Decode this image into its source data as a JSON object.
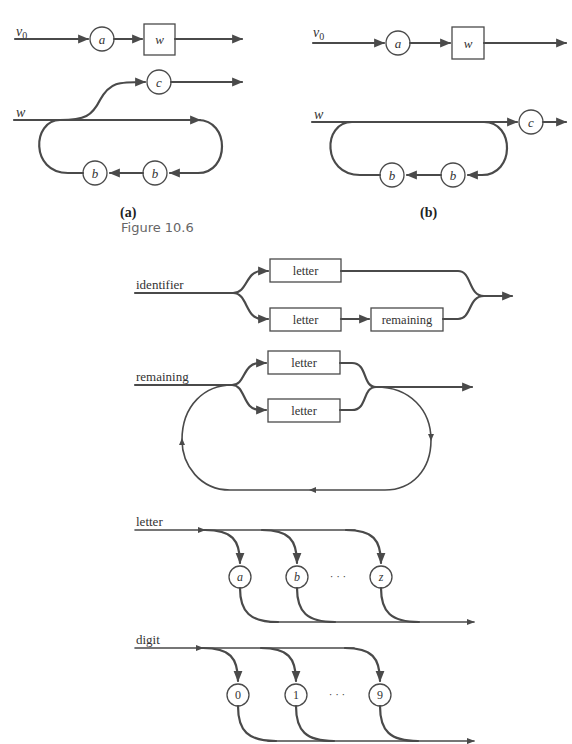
{
  "panel_a": {
    "caption": "(a)",
    "input_label_1": "v",
    "input_sub_1": "0",
    "node_a": "a",
    "box_w": "w",
    "input_label_2": "w",
    "node_c": "c",
    "node_b1": "b",
    "node_b2": "b"
  },
  "panel_b": {
    "caption": "(b)",
    "input_label_1": "v",
    "input_sub_1": "0",
    "node_a": "a",
    "box_w": "w",
    "input_label_2": "w",
    "node_c": "c",
    "node_b1": "b",
    "node_b2": "b"
  },
  "figure_label": "Figure 10.6",
  "syntax": {
    "identifier": {
      "label": "identifier",
      "box_top": "letter",
      "box_bottom": "letter",
      "box_remaining": "remaining"
    },
    "remaining": {
      "label": "remaining",
      "box_top": "letter",
      "box_bottom": "letter"
    },
    "letter": {
      "label": "letter",
      "nodes": [
        "a",
        "b",
        "z"
      ],
      "ellipsis": "· · ·"
    },
    "digit": {
      "label": "digit",
      "nodes": [
        "0",
        "1",
        "9"
      ],
      "ellipsis": "· · ·"
    }
  },
  "colors": {
    "line": "#4a4a4a",
    "text": "#333333",
    "background": "#ffffff"
  }
}
